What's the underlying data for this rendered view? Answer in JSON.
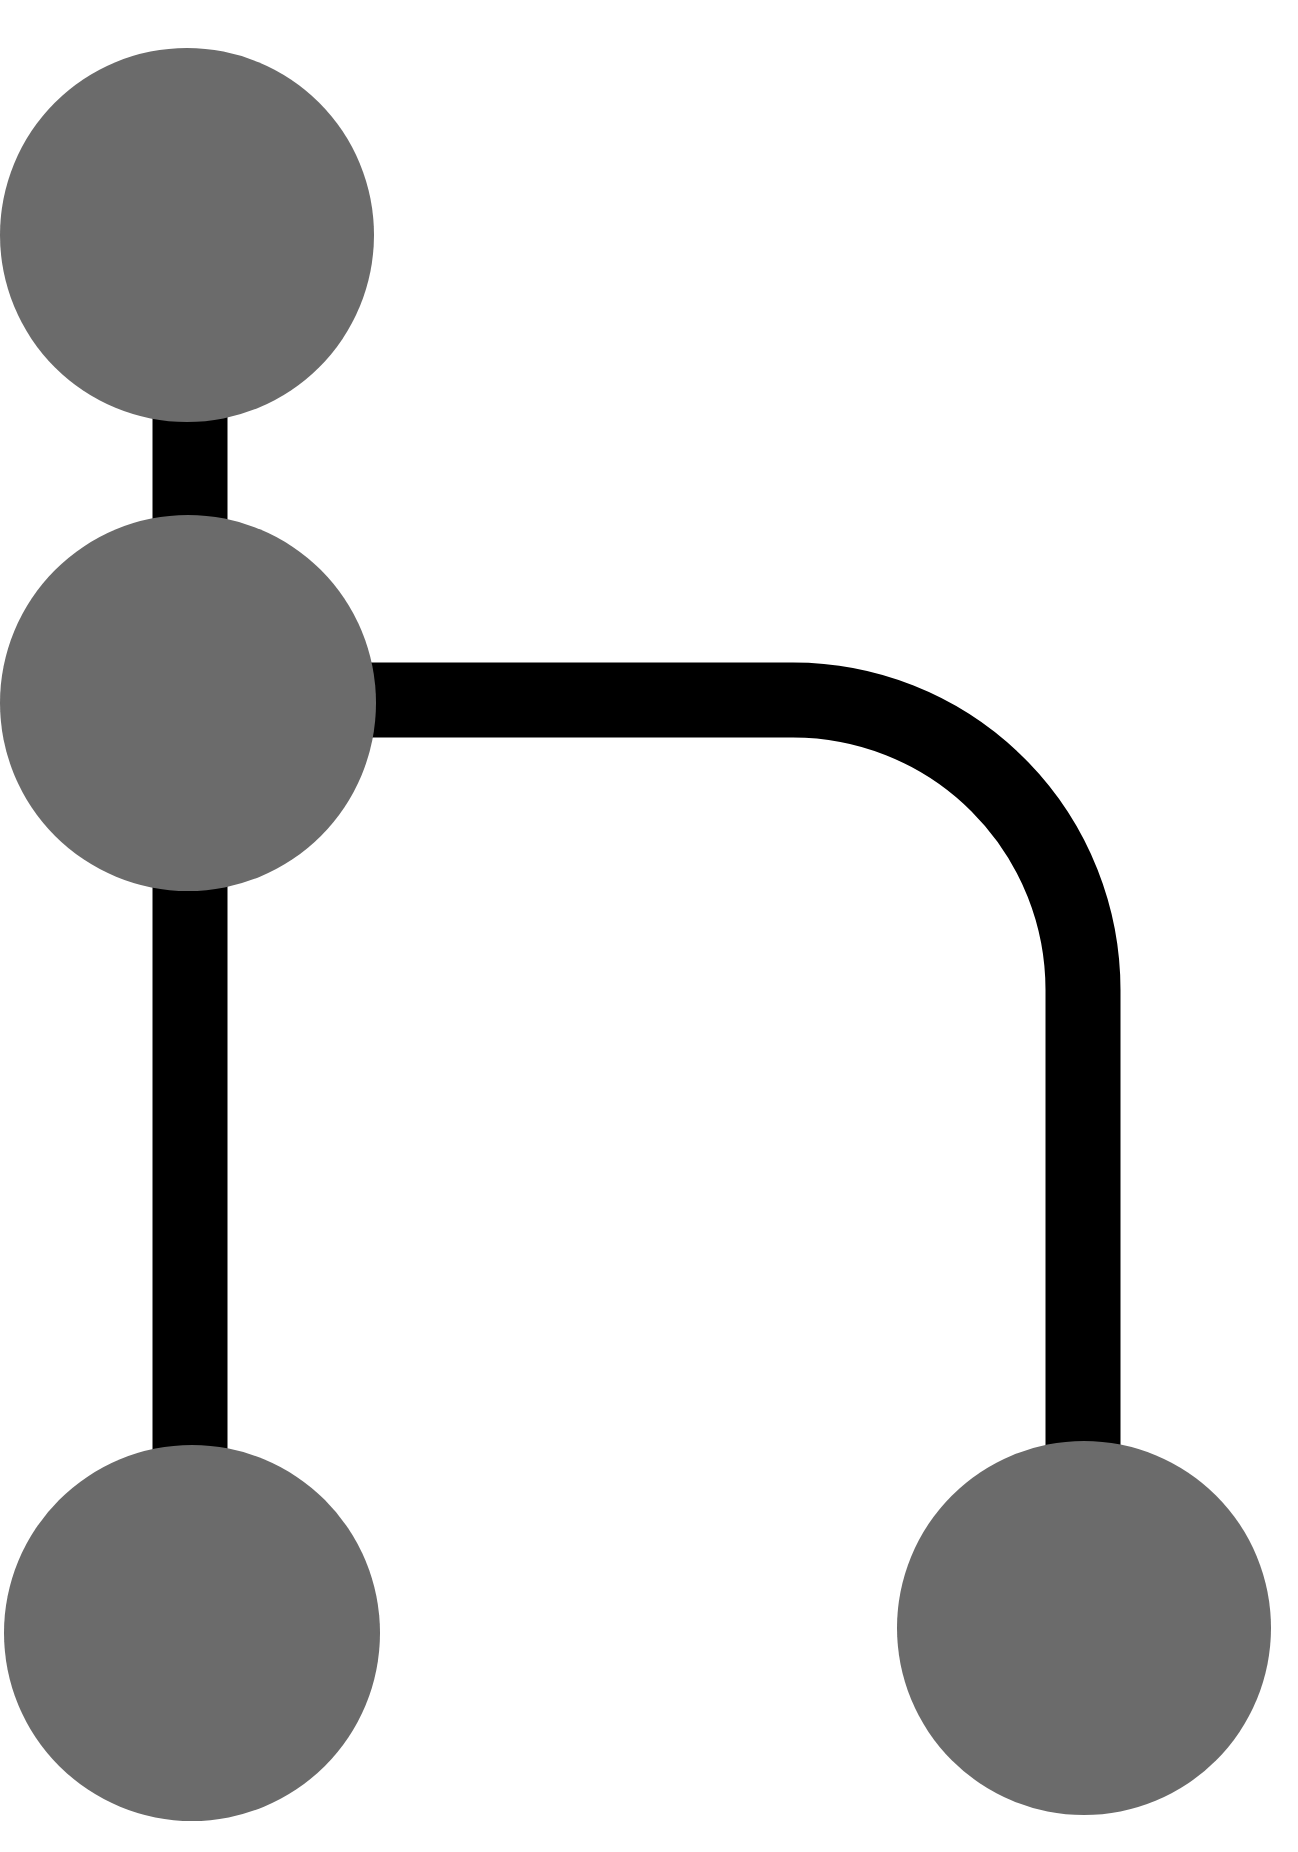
{
  "diagram": {
    "type": "git-branch-graph",
    "background": "#ffffff",
    "edge_color": "#000000",
    "node_color": "#6b6b6b",
    "edge_width": 75,
    "nodes": [
      {
        "id": "commit-top",
        "cx": 187,
        "cy": 235,
        "r": 187
      },
      {
        "id": "commit-branch-point",
        "cx": 188,
        "cy": 703,
        "r": 188
      },
      {
        "id": "commit-main-bottom",
        "cx": 192,
        "cy": 1633,
        "r": 188
      },
      {
        "id": "commit-branch-bottom",
        "cx": 1084,
        "cy": 1628,
        "r": 187
      }
    ],
    "edges": [
      {
        "id": "main-trunk",
        "from": "commit-top",
        "to": "commit-main-bottom",
        "path": "M 190 235 L 190 1633"
      },
      {
        "id": "branch-line",
        "from": "commit-branch-point",
        "to": "commit-branch-bottom",
        "path": "M 188 700 L 793 700 A 290 290 0 0 1 1083 990 L 1083 1628"
      }
    ]
  }
}
